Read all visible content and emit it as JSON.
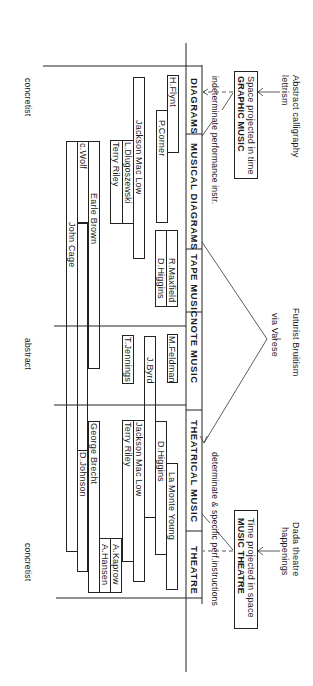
{
  "diagram": {
    "influences": {
      "top": "Abstract calligraphy\nlettrism",
      "top_line1": "Abstract calligraphy",
      "top_line2": "lettrism",
      "middle_line1": "Futurist Bruitism",
      "middle_line2": "via Varese",
      "bottom_line1": "Dada theatre",
      "bottom_line2": "happenings"
    },
    "poles": {
      "graphic_music": {
        "line1": "Space projected in time",
        "line2": "GRAPHIC MUSIC"
      },
      "music_theatre": {
        "line1": "Time projected in space",
        "line2": "MUSIC THEATRE"
      }
    },
    "annotations": {
      "indeterminate": "indeterminate performance instr.",
      "determinate": "determinate & specific perf.instructions"
    },
    "categories": [
      {
        "label": "DIAGRAMS"
      },
      {
        "label": "MUSICAL DIAGRAMS"
      },
      {
        "label": "TAPE MUSIC"
      },
      {
        "label": "NOTE MUSIC"
      },
      {
        "label": "THEATRICAL MUSIC"
      },
      {
        "label": "THEATRE"
      }
    ],
    "axis_labels": {
      "top": "concretist",
      "middle": "abstract",
      "bottom": "concretist"
    },
    "composers": [
      {
        "name": "H.Flynt"
      },
      {
        "name": "P.Corner"
      },
      {
        "name": "Jackson Mac Low"
      },
      {
        "name": "L.Dlugoszewski"
      },
      {
        "name": "Terry Riley"
      },
      {
        "name": "c.Wolf"
      },
      {
        "name": "Earle Brown"
      },
      {
        "name": "John Cage"
      },
      {
        "name": "R.Maxfield"
      },
      {
        "name": "D.Higgins"
      },
      {
        "name": "M.Feldman"
      },
      {
        "name": "J.Byrd"
      },
      {
        "name": "T.Jennings"
      },
      {
        "name": "Jackson Mac Low"
      },
      {
        "name": "Terry Riley"
      },
      {
        "name": "D.Higgins"
      },
      {
        "name": "La Monte Young"
      },
      {
        "name": "George Brecht"
      },
      {
        "name": "D.Johnson"
      },
      {
        "name": "A.Kaprow"
      },
      {
        "name": "A.Hansen"
      }
    ]
  }
}
